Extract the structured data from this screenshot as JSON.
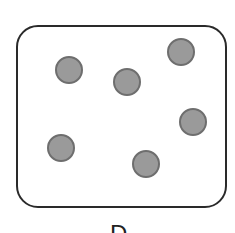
{
  "diagram": {
    "label": "D",
    "circle_count": 6,
    "colors": {
      "circle_fill": "#9a9a9a",
      "circle_stroke": "#6e6e6e",
      "box_stroke": "#2a2a2a"
    },
    "circles": [
      {
        "cx": 69,
        "cy": 70
      },
      {
        "cx": 181,
        "cy": 52
      },
      {
        "cx": 127,
        "cy": 82
      },
      {
        "cx": 193,
        "cy": 122
      },
      {
        "cx": 61,
        "cy": 148
      },
      {
        "cx": 146,
        "cy": 164
      }
    ]
  }
}
